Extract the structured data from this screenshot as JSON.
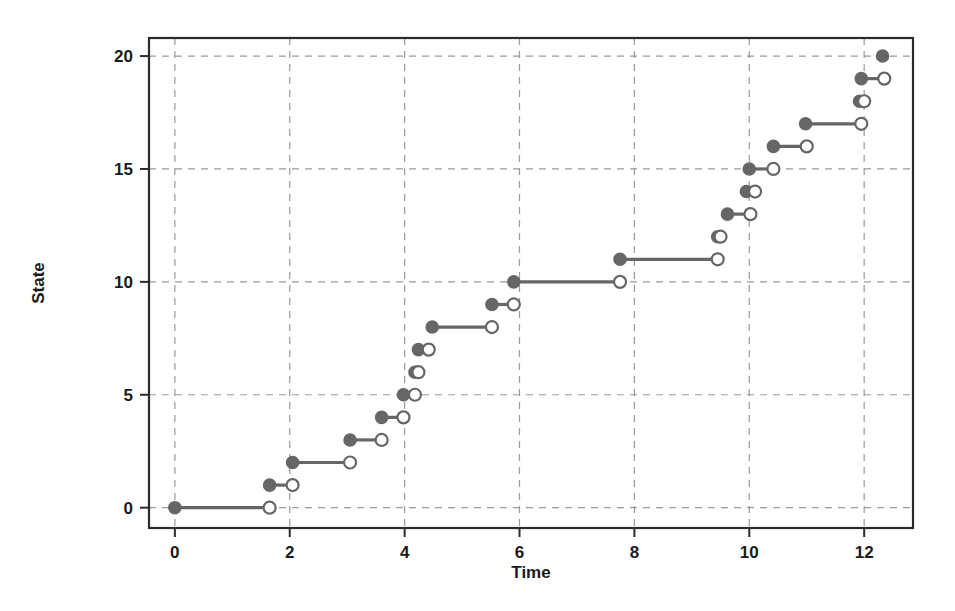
{
  "chart_data": {
    "type": "line",
    "title": "",
    "xlabel": "Time",
    "ylabel": "State",
    "xlim": [
      -0.45,
      12.85
    ],
    "ylim": [
      -0.9,
      20.8
    ],
    "xticks": [
      0,
      2,
      4,
      6,
      8,
      10,
      12
    ],
    "yticks": [
      0,
      5,
      10,
      15,
      20
    ],
    "grid": true,
    "legend": "none",
    "style": "step-hold-segments",
    "marker_start": "filled-circle",
    "marker_end": "open-circle",
    "accent_color": "#666666",
    "series": [
      {
        "name": "State trajectory",
        "segments": [
          {
            "state": 0,
            "t_start": 0.0,
            "t_end": 1.65
          },
          {
            "state": 1,
            "t_start": 1.65,
            "t_end": 2.05
          },
          {
            "state": 2,
            "t_start": 2.05,
            "t_end": 3.05
          },
          {
            "state": 3,
            "t_start": 3.05,
            "t_end": 3.6
          },
          {
            "state": 4,
            "t_start": 3.6,
            "t_end": 3.98
          },
          {
            "state": 5,
            "t_start": 3.98,
            "t_end": 4.18
          },
          {
            "state": 6,
            "t_start": 4.18,
            "t_end": 4.24
          },
          {
            "state": 7,
            "t_start": 4.24,
            "t_end": 4.42
          },
          {
            "state": 8,
            "t_start": 4.48,
            "t_end": 5.52
          },
          {
            "state": 9,
            "t_start": 5.52,
            "t_end": 5.9
          },
          {
            "state": 10,
            "t_start": 5.9,
            "t_end": 7.75
          },
          {
            "state": 11,
            "t_start": 7.75,
            "t_end": 9.45
          },
          {
            "state": 12,
            "t_start": 9.45,
            "t_end": 9.5
          },
          {
            "state": 13,
            "t_start": 9.62,
            "t_end": 10.02
          },
          {
            "state": 14,
            "t_start": 9.95,
            "t_end": 10.1
          },
          {
            "state": 15,
            "t_start": 10.0,
            "t_end": 10.42
          },
          {
            "state": 16,
            "t_start": 10.42,
            "t_end": 11.0
          },
          {
            "state": 17,
            "t_start": 10.98,
            "t_end": 11.95
          },
          {
            "state": 18,
            "t_start": 11.92,
            "t_end": 12.0
          },
          {
            "state": 19,
            "t_start": 11.95,
            "t_end": 12.35
          },
          {
            "state": 20,
            "t_start": 12.32,
            "t_end": 12.32
          }
        ]
      }
    ]
  },
  "axes": {
    "x_tick_labels": [
      "0",
      "2",
      "4",
      "6",
      "8",
      "10",
      "12"
    ],
    "y_tick_labels": [
      "0",
      "5",
      "10",
      "15",
      "20"
    ],
    "x_title": "Time",
    "y_title": "State"
  }
}
